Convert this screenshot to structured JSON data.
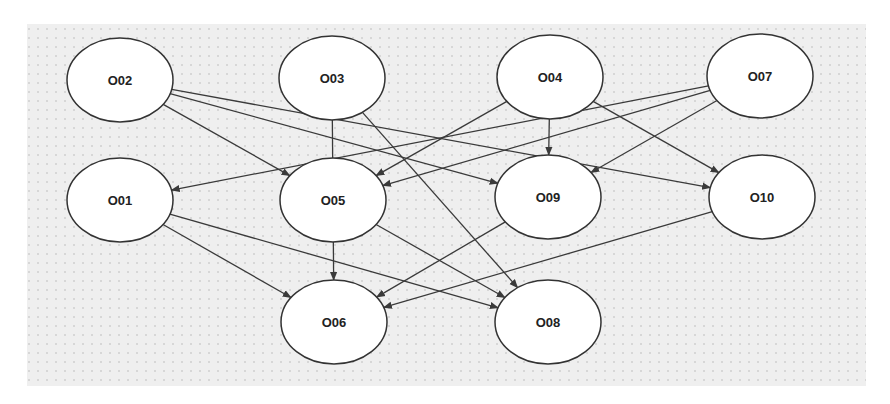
{
  "diagram": {
    "type": "directed-graph",
    "canvas": {
      "x": 27,
      "y": 24,
      "width": 839,
      "height": 362,
      "background": "#efefef",
      "dot_color": "#b8b8b8"
    },
    "node_style": {
      "rx": 53,
      "ry": 42,
      "fill": "#ffffff",
      "stroke": "#333333"
    },
    "edge_color": "#3a3a3a",
    "nodes": [
      {
        "id": "O02",
        "label": "O02",
        "cx": 120,
        "cy": 80
      },
      {
        "id": "O03",
        "label": "O03",
        "cx": 332,
        "cy": 78
      },
      {
        "id": "O04",
        "label": "O04",
        "cx": 550,
        "cy": 77
      },
      {
        "id": "O07",
        "label": "O07",
        "cx": 760,
        "cy": 76
      },
      {
        "id": "O01",
        "label": "O01",
        "cx": 120,
        "cy": 200
      },
      {
        "id": "O05",
        "label": "O05",
        "cx": 333,
        "cy": 200
      },
      {
        "id": "O09",
        "label": "O09",
        "cx": 548,
        "cy": 197
      },
      {
        "id": "O10",
        "label": "O10",
        "cx": 762,
        "cy": 197
      },
      {
        "id": "O06",
        "label": "O06",
        "cx": 334,
        "cy": 322
      },
      {
        "id": "O08",
        "label": "O08",
        "cx": 548,
        "cy": 322
      }
    ],
    "edges": [
      {
        "from": "O02",
        "to": "O05"
      },
      {
        "from": "O02",
        "to": "O09"
      },
      {
        "from": "O02",
        "to": "O10"
      },
      {
        "from": "O03",
        "to": "O06"
      },
      {
        "from": "O03",
        "to": "O08"
      },
      {
        "from": "O04",
        "to": "O05"
      },
      {
        "from": "O04",
        "to": "O09"
      },
      {
        "from": "O04",
        "to": "O10"
      },
      {
        "from": "O07",
        "to": "O01"
      },
      {
        "from": "O07",
        "to": "O05"
      },
      {
        "from": "O07",
        "to": "O09"
      },
      {
        "from": "O01",
        "to": "O06"
      },
      {
        "from": "O01",
        "to": "O08"
      },
      {
        "from": "O05",
        "to": "O08"
      },
      {
        "from": "O09",
        "to": "O06"
      },
      {
        "from": "O10",
        "to": "O06"
      }
    ]
  }
}
